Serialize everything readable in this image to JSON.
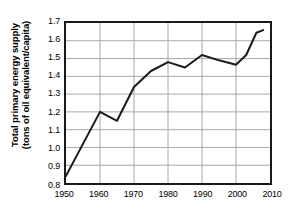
{
  "chart_data": {
    "type": "line",
    "title": "",
    "xlabel": "",
    "ylabel": "Total primary energy supply (tons of oil equivalent/capita)",
    "ylabel_line1": "Total primary energy supply",
    "ylabel_line2": "(tons of oil equivalent/capita)",
    "xlim": [
      1950,
      2010
    ],
    "ylim": [
      0.8,
      1.7
    ],
    "grid": true,
    "legend": "none",
    "x_ticks": [
      1950,
      1960,
      1970,
      1980,
      1990,
      2000,
      2010
    ],
    "x_tick_labels": [
      "1950",
      "1960",
      "1970",
      "1980",
      "1990",
      "2000",
      "2010"
    ],
    "y_ticks": [
      0.8,
      0.9,
      1.0,
      1.1,
      1.2,
      1.3,
      1.4,
      1.5,
      1.6,
      1.7
    ],
    "y_tick_labels": [
      "0.8",
      "0.9",
      "1.0",
      "1.1",
      "1.2",
      "1.3",
      "1.4",
      "1.5",
      "1.6",
      "1.7"
    ],
    "series": [
      {
        "name": "Total primary energy supply",
        "color": "#1a1a1a",
        "x": [
          1950,
          1960,
          1965,
          1970,
          1975,
          1980,
          1985,
          1990,
          1995,
          2000,
          2003,
          2006,
          2008
        ],
        "y": [
          0.84,
          1.2,
          1.15,
          1.34,
          1.43,
          1.48,
          1.45,
          1.52,
          1.49,
          1.465,
          1.52,
          1.645,
          1.66
        ]
      }
    ]
  },
  "style": {
    "line_color": "#1a1a1a",
    "grid_color": "#a8a8a8",
    "frame_color": "#1a1a1a",
    "background": "#ffffff"
  }
}
